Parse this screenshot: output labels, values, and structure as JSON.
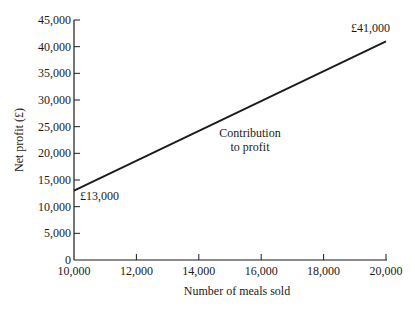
{
  "chart_data": {
    "type": "line",
    "title": "",
    "xlabel": "Number of meals sold",
    "ylabel": "Net profit (£)",
    "xlim": [
      10000,
      20000
    ],
    "ylim": [
      0,
      45000
    ],
    "x_ticks": [
      "10,000",
      "12,000",
      "14,000",
      "16,000",
      "18,000",
      "20,000"
    ],
    "y_ticks": [
      "0",
      "5,000",
      "10,000",
      "15,000",
      "20,000",
      "25,000",
      "30,000",
      "35,000",
      "40,000",
      "45,000"
    ],
    "grid": false,
    "legend": null,
    "series": [
      {
        "name": "Net profit",
        "x": [
          10000,
          20000
        ],
        "y": [
          13000,
          41000
        ]
      }
    ],
    "annotations": [
      {
        "text": "£13,000",
        "x": 10000,
        "y": 13000
      },
      {
        "text": "£41,000",
        "x": 20000,
        "y": 41000
      },
      {
        "text": "Contribution",
        "line": 1
      },
      {
        "text": "to profit",
        "line": 2
      }
    ]
  }
}
